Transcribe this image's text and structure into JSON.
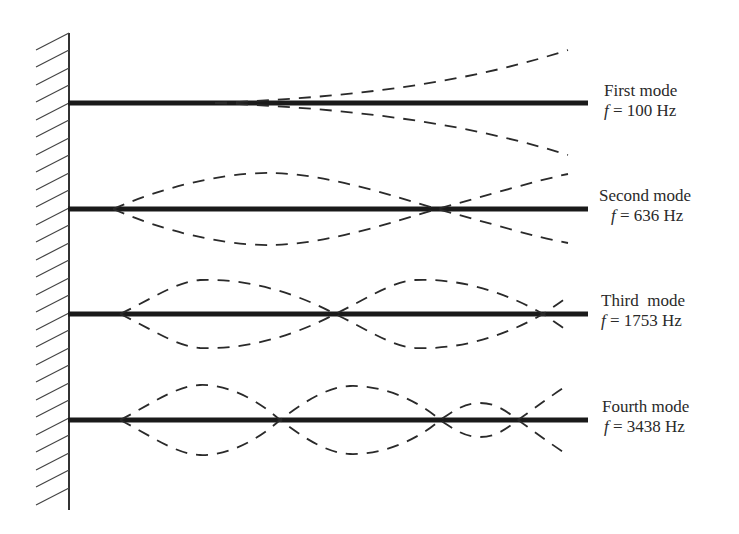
{
  "figure": {
    "support": "fixed-wall",
    "colors": {
      "beam": "#1a1a1a",
      "mode_curve": "#2a2a2a",
      "wall": "#333333",
      "background": "#ffffff"
    }
  },
  "modes": [
    {
      "name": "First mode",
      "freq_symbol": "f",
      "freq_text": "= 100 Hz",
      "frequency_hz": 100,
      "nodes": 0
    },
    {
      "name": "Second mode",
      "freq_symbol": "f",
      "freq_text": "= 636 Hz",
      "frequency_hz": 636,
      "nodes": 1
    },
    {
      "name": "Third  mode",
      "freq_symbol": "f",
      "freq_text": "= 1753 Hz",
      "frequency_hz": 1753,
      "nodes": 2
    },
    {
      "name": "Fourth mode",
      "freq_symbol": "f",
      "freq_text": "= 3438 Hz",
      "frequency_hz": 3438,
      "nodes": 3
    }
  ]
}
